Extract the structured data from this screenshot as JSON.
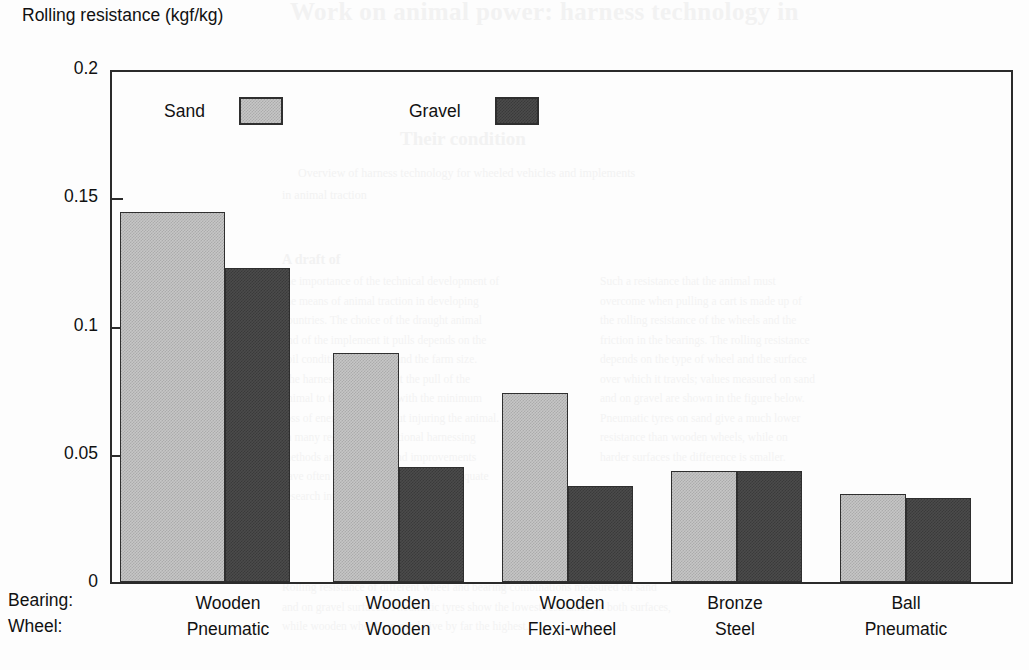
{
  "axis_title": "Rolling resistance\n(kgf/kg)",
  "legend": {
    "sand_label": "Sand",
    "gravel_label": "Gravel"
  },
  "xaxis": {
    "row_headers": [
      "Bearing:",
      "Wheel:"
    ]
  },
  "bleed_through": {
    "title": "Work on animal power: harness technology in",
    "subtitle": "Their condition",
    "line1": "Overview of harness technology for wheeled vehicles and implements",
    "line2": "in animal traction",
    "heading2": "A draft of",
    "col_a": "the importance of the technical development of\nthe means of animal traction in developing\ncountries. The choice of the draught animal\nand of the implement it pulls depends on the\nsoil conditions, the crop and the farm size.\nThe harness must transmit the pull of the\nanimal to the implement with the minimum\nloss of energy, and without injuring the animal.\nIn many regions the traditional harnessing\nmethods are still in use and improvements\nhave often been introduced without adequate\nresearch into local conditions.",
    "col_b": "Such a resistance that the animal must\novercome when pulling a cart is made up of\nthe rolling resistance of the wheels and the\nfriction in the bearings. The rolling resistance\ndepends on the type of wheel and the surface\nover which it travels; values measured on sand\nand on gravel are shown in the figure below.\nPneumatic tyres on sand give a much lower\nresistance than wooden wheels, while on\nharder surfaces the difference is smaller.",
    "footer": "Rolling resistance of different wheel and bearing combinations measured on sand\nand on gravel surfaces. Pneumatic tyres show the lowest resistance on both surfaces,\nwhile wooden wheels on sand give by far the highest."
  },
  "chart_data": {
    "type": "bar",
    "title": "",
    "xlabel": "",
    "ylabel": "Rolling resistance (kgf/kg)",
    "ylim": [
      0,
      0.2
    ],
    "yticks": [
      0,
      0.05,
      0.1,
      0.15,
      0.2
    ],
    "ytick_labels": [
      "0",
      "0.05",
      "0.1",
      "0.15",
      "0.2"
    ],
    "grid": false,
    "legend_position": "inside-top-left",
    "categories": [
      {
        "bearing": "Wooden",
        "wheel": "Pneumatic"
      },
      {
        "bearing": "Wooden",
        "wheel": "Wooden"
      },
      {
        "bearing": "Wooden",
        "wheel": "Flexi-wheel"
      },
      {
        "bearing": "Bronze",
        "wheel": "Steel"
      },
      {
        "bearing": "Ball",
        "wheel": "Pneumatic"
      }
    ],
    "series": [
      {
        "name": "Sand",
        "color": "#c6c6c6",
        "values": [
          0.145,
          0.09,
          0.074,
          0.0435,
          0.0345
        ]
      },
      {
        "name": "Gravel",
        "color": "#4b4b4b",
        "values": [
          0.123,
          0.045,
          0.0375,
          0.0435,
          0.033
        ]
      }
    ]
  }
}
